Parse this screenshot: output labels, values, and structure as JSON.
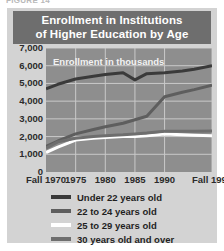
{
  "top_caption": "FIGURE 14",
  "card": {
    "title": "Enrollment in Institutions\nof Higher Education by Age"
  },
  "chart_data": {
    "type": "line",
    "title": "Enrollment in Institutions of Higher Education by Age",
    "annotation": "Enrollment in thousands",
    "xlabel": "",
    "ylabel": "Enrollment in thousands",
    "grid": true,
    "legend_position": "bottom",
    "xlim": [
      1970,
      1998
    ],
    "ylim": [
      0,
      7000
    ],
    "yticks": [
      "0",
      "1,000",
      "2,000",
      "3,000",
      "4,000",
      "5,000",
      "6,000",
      "7,000"
    ],
    "ytick_values": [
      0,
      1000,
      2000,
      3000,
      4000,
      5000,
      6000,
      7000
    ],
    "xticks": [
      "Fall 1970",
      "1975",
      "1980",
      "1985",
      "1990",
      "Fall 1998"
    ],
    "xtick_values": [
      1970,
      1975,
      1980,
      1985,
      1990,
      1998
    ],
    "x": [
      1970,
      1972,
      1975,
      1978,
      1980,
      1983,
      1985,
      1987,
      1990,
      1993,
      1995,
      1998
    ],
    "series": [
      {
        "name": "Under 22 years old",
        "color": "#3a3a3a",
        "values": [
          4700,
          4950,
          5250,
          5400,
          5500,
          5600,
          5200,
          5550,
          5600,
          5700,
          5800,
          6000
        ]
      },
      {
        "name": "22 to 24 years old",
        "color": "#5e5e5e",
        "values": [
          1450,
          1750,
          2150,
          2400,
          2550,
          2750,
          2950,
          3150,
          4250,
          4500,
          4650,
          4900
        ]
      },
      {
        "name": "25 to 29 years old",
        "color": "#ffffff",
        "values": [
          1100,
          1400,
          1800,
          1900,
          1950,
          2000,
          2000,
          2050,
          2150,
          2100,
          2080,
          2050
        ]
      },
      {
        "name": "30 years old and over",
        "color": "#6e6e6e",
        "values": [
          1350,
          1700,
          1900,
          2000,
          2050,
          2100,
          2150,
          2200,
          2300,
          2300,
          2300,
          2320
        ]
      }
    ]
  },
  "legend": {
    "items": [
      {
        "label": "Under 22 years old",
        "color": "#3a3a3a"
      },
      {
        "label": "22 to 24 years old",
        "color": "#5e5e5e"
      },
      {
        "label": "25 to 29 years old",
        "color": "#ffffff"
      },
      {
        "label": "30 years old and over",
        "color": "#6e6e6e"
      }
    ]
  },
  "colors": {
    "page_background": "#ffffff",
    "card_background": "#d3d3d3",
    "title_banner": "#6e6e6e",
    "plot_background": "#8e8e8e",
    "gridline": "#c9c9c9",
    "axis_text": "#2b2b2b"
  }
}
